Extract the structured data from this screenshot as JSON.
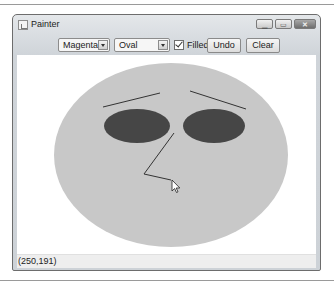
{
  "window": {
    "title": "Painter",
    "controls": {
      "minimize": "minimize-icon",
      "maximize": "maximize-icon",
      "close": "close-icon"
    }
  },
  "toolbar": {
    "color_select": {
      "value": "Magenta"
    },
    "shape_select": {
      "value": "Oval"
    },
    "filled_checkbox": {
      "label": "Filled",
      "checked": true
    },
    "undo_label": "Undo",
    "clear_label": "Clear"
  },
  "canvas": {
    "background": "#ffffff",
    "shapes": [
      {
        "type": "oval",
        "filled": true,
        "color": "#c8c8c8",
        "cx": 171,
        "cy": 155,
        "rx": 117,
        "ry": 92
      },
      {
        "type": "line",
        "color": "#333333",
        "x1": 103,
        "y1": 107,
        "x2": 160,
        "y2": 93
      },
      {
        "type": "line",
        "color": "#333333",
        "x1": 190,
        "y1": 91,
        "x2": 246,
        "y2": 109
      },
      {
        "type": "oval",
        "filled": true,
        "color": "#464646",
        "cx": 137,
        "cy": 126,
        "rx": 33,
        "ry": 17
      },
      {
        "type": "oval",
        "filled": true,
        "color": "#464646",
        "cx": 214,
        "cy": 126,
        "rx": 31,
        "ry": 17
      },
      {
        "type": "polyline",
        "color": "#333333",
        "points": "174,133 144,174 171,180"
      }
    ],
    "cursor": {
      "icon": "arrow-cursor-icon",
      "x": 172,
      "y": 180
    }
  },
  "status_bar": {
    "coordinates": "(250,191)"
  }
}
